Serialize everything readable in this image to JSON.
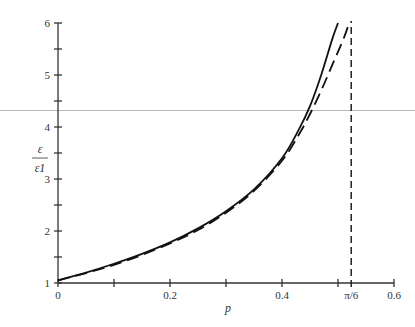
{
  "chart_data": {
    "type": "line",
    "title": "",
    "xlabel": "p",
    "ylabel": "ε / ε1",
    "ylabel_num": "ε",
    "ylabel_den": "ε1",
    "xlim": [
      0,
      0.6
    ],
    "ylim": [
      1,
      6
    ],
    "xticks": [
      0,
      0.2,
      0.4,
      0.6
    ],
    "xtick_labels": [
      "0",
      "0.2",
      "0.4",
      "0.6"
    ],
    "yticks": [
      1,
      2,
      3,
      4,
      5,
      6
    ],
    "ytick_labels": [
      "1",
      "2",
      "3",
      "4",
      "5",
      "6"
    ],
    "minor_xticks": [
      0.1,
      0.3,
      0.5
    ],
    "minor_yticks": [
      1.5,
      2.5,
      3.5,
      4.5,
      5.5
    ],
    "asymptote": {
      "x": 0.5236,
      "label": "π/6",
      "style": "dashed"
    },
    "grid": false,
    "legend": null,
    "series": [
      {
        "name": "solid",
        "style": "solid",
        "x": [
          0,
          0.05,
          0.1,
          0.15,
          0.2,
          0.25,
          0.3,
          0.35,
          0.4,
          0.43,
          0.45,
          0.47,
          0.49,
          0.5
        ],
        "y": [
          1.05,
          1.2,
          1.37,
          1.56,
          1.78,
          2.05,
          2.38,
          2.8,
          3.4,
          3.95,
          4.4,
          5.0,
          5.7,
          6.0
        ]
      },
      {
        "name": "dashed",
        "style": "dashed",
        "x": [
          0,
          0.05,
          0.1,
          0.15,
          0.2,
          0.25,
          0.3,
          0.35,
          0.4,
          0.43,
          0.45,
          0.47,
          0.49,
          0.51,
          0.52
        ],
        "y": [
          1.05,
          1.19,
          1.35,
          1.54,
          1.76,
          2.02,
          2.35,
          2.77,
          3.35,
          3.85,
          4.25,
          4.7,
          5.2,
          5.7,
          6.0
        ]
      }
    ]
  }
}
